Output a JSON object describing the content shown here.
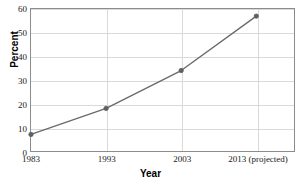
{
  "chart_data": {
    "type": "line",
    "title": "",
    "xlabel": "Year",
    "ylabel": "Percent",
    "categories": [
      "1983",
      "1993",
      "2003",
      "2013 (projected)"
    ],
    "values": [
      7,
      18,
      34,
      57
    ],
    "series": [
      {
        "name": "Percent",
        "values": [
          7,
          18,
          34,
          57
        ]
      }
    ],
    "ylim": [
      0,
      60
    ],
    "ytick_labels": [
      "0",
      "10",
      "20",
      "30",
      "40",
      "50",
      "60"
    ],
    "ytick_values": [
      0,
      10,
      20,
      30,
      40,
      50,
      60
    ],
    "xtick_labels": [
      "1983",
      "1993",
      "2003",
      "2013 (projected)"
    ],
    "grid": "horizontal-and-vertical",
    "legend": "none",
    "line_color": "#6b6b6b",
    "marker_color": "#5f5f5f",
    "marker_shape": "circle",
    "gridline_color": "#d9d9d9",
    "frame_color": "#8c8c8c",
    "background_color": "#ffffff"
  }
}
